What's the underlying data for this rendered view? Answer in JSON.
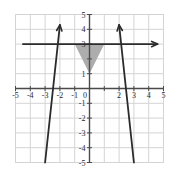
{
  "chart_data": {
    "type": "line",
    "title": "",
    "xlabel": "",
    "ylabel": "",
    "xlim": [
      -5,
      5
    ],
    "ylim": [
      -5,
      5
    ],
    "grid": true,
    "grid_step": 1,
    "legend": "none",
    "x_ticks": [
      -5,
      -4,
      -3,
      -2,
      -1,
      0,
      1,
      2,
      3,
      4,
      5
    ],
    "x_tick_labels": [
      "-5",
      "-4",
      "-3",
      "-2",
      "-1",
      "0",
      "1",
      "2",
      "3",
      "4",
      "5"
    ],
    "x_tick_labels_visible": [
      "-5",
      "-4",
      "-3",
      "-2",
      "-1",
      "0",
      "2",
      "3",
      "4",
      "5"
    ],
    "y_ticks": [
      -5,
      -4,
      -3,
      -2,
      -1,
      1,
      2,
      3,
      4,
      5
    ],
    "y_tick_labels": [
      "-5",
      "-4",
      "-3",
      "-2",
      "-1",
      "1",
      "2",
      "3",
      "4",
      "5"
    ],
    "y_tick_labels_visible": [
      "5",
      "4",
      "3",
      "1",
      "-1",
      "-2",
      "-3",
      "-4",
      "-5"
    ],
    "series": [
      {
        "name": "horizontal-line",
        "label": "y = 3",
        "type": "line",
        "color": "#2b2b2b",
        "points": [
          [
            -4.5,
            3
          ],
          [
            4.6,
            3
          ]
        ],
        "arrow_start": false,
        "arrow_end": true
      },
      {
        "name": "line-positive-slope",
        "label": "y = 2x + 1",
        "type": "line",
        "color": "#2b2b2b",
        "points": [
          [
            -3.0,
            -5.0
          ],
          [
            -2.0,
            4.3
          ]
        ],
        "arrow_start": false,
        "arrow_end": true,
        "through": [
          [
            0,
            1
          ]
        ],
        "slope": 2,
        "intercept": 1
      },
      {
        "name": "line-negative-slope",
        "label": "y = -2x + 1",
        "type": "line",
        "color": "#2b2b2b",
        "points": [
          [
            3.0,
            -5.0
          ],
          [
            2.0,
            4.3
          ]
        ],
        "arrow_start": false,
        "arrow_end": true,
        "through": [
          [
            0,
            1
          ]
        ],
        "slope": -2,
        "intercept": 1
      }
    ],
    "shaded_regions": [
      {
        "name": "solution-region",
        "label": "shaded triangle",
        "color": "#a9a9a9",
        "vertices": [
          [
            -1,
            3
          ],
          [
            1,
            3
          ],
          [
            0,
            1
          ]
        ]
      }
    ],
    "intersection_points": [
      [
        0,
        1
      ],
      [
        -1,
        3
      ],
      [
        1,
        3
      ]
    ]
  },
  "colors": {
    "grid": "#d4d4d4",
    "axis": "#4a4a4a",
    "curve": "#2b2b2b",
    "shade": "#a9a9a9",
    "background": "#ffffff",
    "border": "#e0e0e0"
  }
}
